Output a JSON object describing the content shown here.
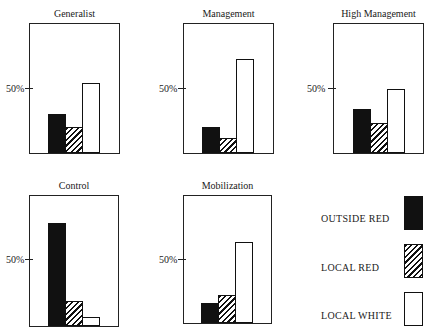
{
  "chart_data": {
    "type": "bar",
    "ylabel_tick": "50%",
    "ylim": [
      0,
      100
    ],
    "series_names": [
      "OUTSIDE RED",
      "LOCAL RED",
      "LOCAL WHITE"
    ],
    "panels": [
      {
        "title": "Generalist",
        "values": {
          "outside_red": 30,
          "local_red": 20,
          "local_white": 54
        }
      },
      {
        "title": "Management",
        "values": {
          "outside_red": 20,
          "local_red": 12,
          "local_white": 73
        }
      },
      {
        "title": "High Management",
        "values": {
          "outside_red": 34,
          "local_red": 23,
          "local_white": 50
        }
      },
      {
        "title": "Control",
        "values": {
          "outside_red": 79,
          "local_red": 19,
          "local_white": 7
        }
      },
      {
        "title": "Mobilization",
        "values": {
          "outside_red": 16,
          "local_red": 22,
          "local_white": 64
        }
      }
    ],
    "legend": [
      {
        "label": "OUTSIDE RED",
        "pattern": "solid-black"
      },
      {
        "label": "LOCAL RED",
        "pattern": "diagonal-hatch"
      },
      {
        "label": "LOCAL WHITE",
        "pattern": "white"
      }
    ],
    "legend_position": "bottom-right",
    "grid": false
  },
  "panels": [
    {
      "title": "Generalist",
      "tick": "50%"
    },
    {
      "title": "Management",
      "tick": "50%"
    },
    {
      "title": "High Management",
      "tick": "50%"
    },
    {
      "title": "Control",
      "tick": "50%"
    },
    {
      "title": "Mobilization",
      "tick": "50%"
    }
  ],
  "legend": {
    "outside_red": "OUTSIDE RED",
    "local_red": "LOCAL RED",
    "local_white": "LOCAL WHITE"
  },
  "colors": {
    "ink": "#111111",
    "background": "#ffffff"
  }
}
